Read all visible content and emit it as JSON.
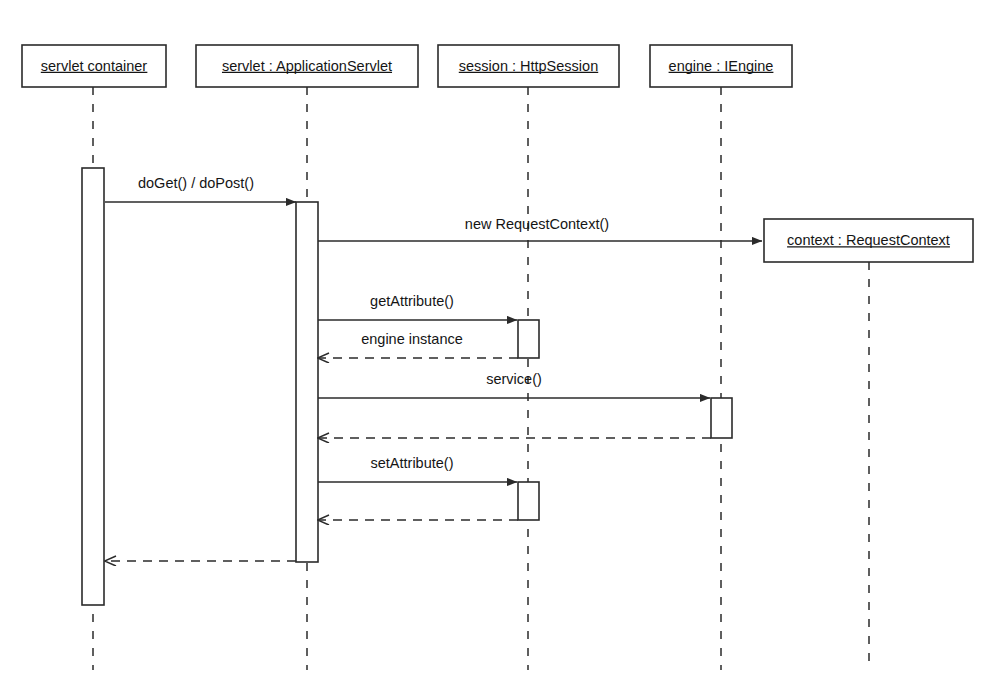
{
  "diagram": {
    "kind": "uml-sequence-diagram",
    "stroke_color": "#2b2b2b",
    "text_color": "#151515",
    "background_color": "#ffffff"
  },
  "lifelines": [
    {
      "id": "container",
      "label": "servlet container",
      "box": {
        "x": 22,
        "y": 45,
        "w": 144,
        "h": 42
      },
      "axis_x": 93,
      "dash_top": 87,
      "dash_bottom": 670
    },
    {
      "id": "servlet",
      "label": "servlet : ApplicationServlet",
      "box": {
        "x": 196,
        "y": 45,
        "w": 222,
        "h": 42
      },
      "axis_x": 307,
      "dash_top": 87,
      "dash_bottom": 670
    },
    {
      "id": "session",
      "label": "session : HttpSession",
      "box": {
        "x": 438,
        "y": 45,
        "w": 181,
        "h": 42
      },
      "axis_x": 528,
      "dash_top": 87,
      "dash_bottom": 670
    },
    {
      "id": "engine",
      "label": "engine : IEngine",
      "box": {
        "x": 650,
        "y": 45,
        "w": 142,
        "h": 42
      },
      "axis_x": 721,
      "dash_top": 87,
      "dash_bottom": 670
    },
    {
      "id": "context",
      "label": "context : RequestContext",
      "box": {
        "x": 764,
        "y": 219,
        "w": 209,
        "h": 43
      },
      "axis_x": 869,
      "dash_top": 262,
      "dash_bottom": 670
    }
  ],
  "activations": [
    {
      "id": "act-container",
      "lifeline": "container",
      "x": 82,
      "y": 168,
      "w": 22,
      "h": 437
    },
    {
      "id": "act-servlet",
      "lifeline": "servlet",
      "x": 296,
      "y": 202,
      "w": 22,
      "h": 360
    },
    {
      "id": "act-session-get",
      "lifeline": "session",
      "x": 518,
      "y": 320,
      "w": 21,
      "h": 38
    },
    {
      "id": "act-engine-service",
      "lifeline": "engine",
      "x": 711,
      "y": 398,
      "w": 21,
      "h": 40
    },
    {
      "id": "act-session-set",
      "lifeline": "session",
      "x": 518,
      "y": 482,
      "w": 21,
      "h": 38
    }
  ],
  "messages": [
    {
      "id": "msg-doget",
      "label": "doGet() / doPost()",
      "type": "synchronous",
      "from_x": 105,
      "to_x": 296,
      "y": 202,
      "label_x": 196,
      "label_y": 184
    },
    {
      "id": "msg-new-requestcontext",
      "label": "new RequestContext()",
      "type": "synchronous",
      "from_x": 318,
      "to_x": 762,
      "y": 241,
      "label_x": 537,
      "label_y": 225
    },
    {
      "id": "msg-getattribute",
      "label": "getAttribute()",
      "type": "synchronous",
      "from_x": 318,
      "to_x": 517,
      "y": 320,
      "label_x": 412,
      "label_y": 302
    },
    {
      "id": "msg-engine-instance",
      "label": "engine instance",
      "type": "return",
      "from_x": 518,
      "to_x": 318,
      "y": 358,
      "label_x": 412,
      "label_y": 340
    },
    {
      "id": "msg-service",
      "label": "service()",
      "type": "synchronous",
      "from_x": 318,
      "to_x": 710,
      "y": 398,
      "label_x": 514,
      "label_y": 380
    },
    {
      "id": "msg-service-return",
      "label": "",
      "type": "return",
      "from_x": 711,
      "to_x": 318,
      "y": 438,
      "label_x": 514,
      "label_y": 420
    },
    {
      "id": "msg-setattribute",
      "label": "setAttribute()",
      "type": "synchronous",
      "from_x": 318,
      "to_x": 517,
      "y": 482,
      "label_x": 412,
      "label_y": 464
    },
    {
      "id": "msg-setattribute-return",
      "label": "",
      "type": "return",
      "from_x": 518,
      "to_x": 318,
      "y": 520,
      "label_x": 412,
      "label_y": 502
    },
    {
      "id": "msg-doget-return",
      "label": "",
      "type": "return",
      "from_x": 296,
      "to_x": 105,
      "y": 561,
      "label_x": 200,
      "label_y": 545
    }
  ]
}
